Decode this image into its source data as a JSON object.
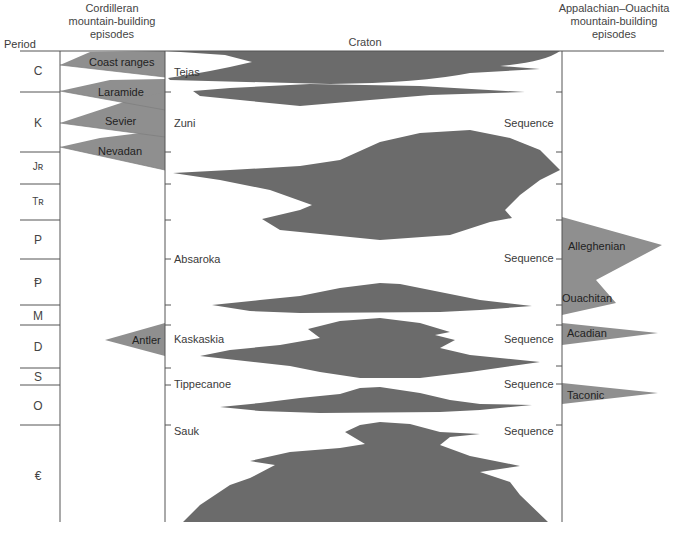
{
  "headers": {
    "period": "Period",
    "cordilleran": [
      "Cordilleran",
      "mountain-building",
      "episodes"
    ],
    "craton": "Craton",
    "appalachian": [
      "Appalachian–Ouachita",
      "mountain-building",
      "episodes"
    ]
  },
  "periods": [
    {
      "symbol": "C",
      "y": 60
    },
    {
      "symbol": "K",
      "y": 123
    },
    {
      "symbol": "Jʀ",
      "y": 167
    },
    {
      "symbol": "Tʀ",
      "y": 202
    },
    {
      "symbol": "P",
      "y": 240
    },
    {
      "symbol": "Ᵽ",
      "y": 282
    },
    {
      "symbol": "M",
      "y": 315
    },
    {
      "symbol": "D",
      "y": 346
    },
    {
      "symbol": "S",
      "y": 377
    },
    {
      "symbol": "O",
      "y": 406
    },
    {
      "symbol": "€",
      "y": 476
    }
  ],
  "cordilleran_episodes": [
    {
      "name": "Coast ranges"
    },
    {
      "name": "Laramide"
    },
    {
      "name": "Sevier"
    },
    {
      "name": "Nevadan"
    },
    {
      "name": "Antler"
    }
  ],
  "sequences": [
    {
      "name": "Tejas",
      "suffix": ""
    },
    {
      "name": "Zuni",
      "suffix": "Sequence"
    },
    {
      "name": "Absaroka",
      "suffix": "Sequence"
    },
    {
      "name": "Kaskaskia",
      "suffix": "Sequence"
    },
    {
      "name": "Tippecanoe",
      "suffix": "Sequence"
    },
    {
      "name": "Sauk",
      "suffix": "Sequence"
    }
  ],
  "appalachian_episodes": [
    {
      "name": "Alleghenian"
    },
    {
      "name": "Ouachitan"
    },
    {
      "name": "Acadian"
    },
    {
      "name": "Taconic"
    }
  ],
  "colors": {
    "craton_fill": "#6b6b6b",
    "orogeny_fill": "#8f8f8f",
    "line": "#555555"
  }
}
